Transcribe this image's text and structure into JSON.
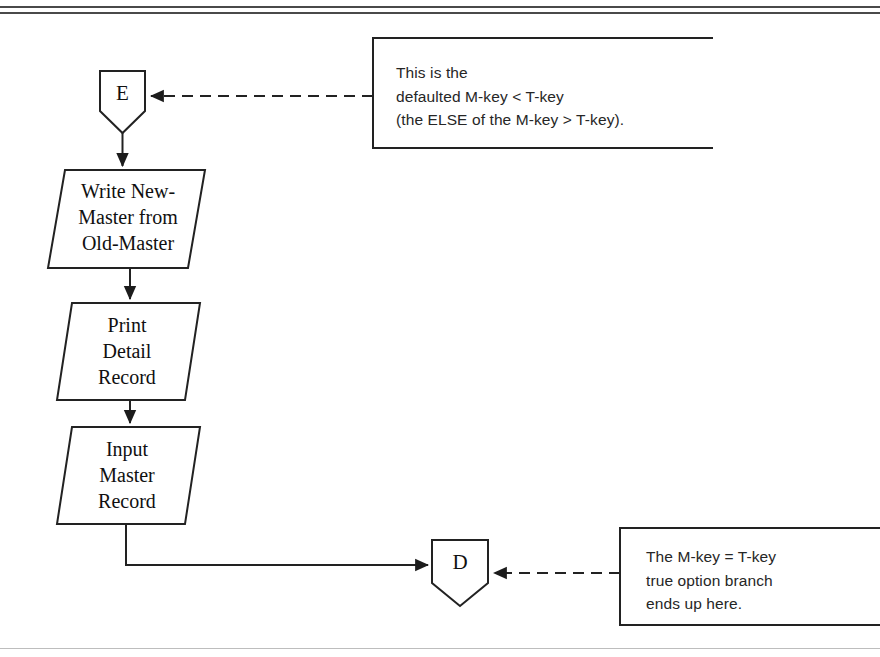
{
  "page": {
    "background_color": "#ffffff",
    "line_color": "#222222",
    "rule_color": "#4a4a4a"
  },
  "diagram": {
    "type": "flowchart",
    "connectors": [
      {
        "id": "conn-e",
        "label": "E",
        "shape": "connector-pentagon"
      },
      {
        "id": "conn-d",
        "label": "D",
        "shape": "connector-pentagon"
      }
    ],
    "process_nodes": [
      {
        "id": "node-write-new-master",
        "label": "Write New-\nMaster from\nOld-Master",
        "shape": "parallelogram"
      },
      {
        "id": "node-print-detail-record",
        "label": "Print\nDetail\nRecord",
        "shape": "parallelogram"
      },
      {
        "id": "node-input-master-record",
        "label": "Input\nMaster\nRecord",
        "shape": "parallelogram"
      }
    ],
    "annotations": [
      {
        "id": "note-else-branch",
        "text": "This is the\ndefaulted M-key < T-key\n(the ELSE of the M-key > T-key).",
        "connector_style": "dashed",
        "points_to": "E"
      },
      {
        "id": "note-true-branch",
        "text": "The M-key  =  T-key\ntrue option branch\nends up here.",
        "connector_style": "dashed",
        "points_to": "D"
      }
    ],
    "flow_edges": [
      {
        "from": "E",
        "to": "node-write-new-master",
        "style": "solid-arrow"
      },
      {
        "from": "node-write-new-master",
        "to": "node-print-detail-record",
        "style": "solid-arrow"
      },
      {
        "from": "node-print-detail-record",
        "to": "node-input-master-record",
        "style": "solid-arrow"
      },
      {
        "from": "node-input-master-record",
        "to": "D",
        "style": "solid-arrow-elbow"
      }
    ]
  }
}
